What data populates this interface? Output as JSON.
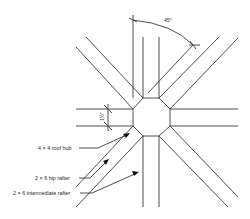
{
  "diagram": {
    "type": "technical-plan-view",
    "dimensions": {
      "angle_label": "45°",
      "width_label": "1½\""
    },
    "labels": {
      "hub": "4 × 4 roof hub",
      "hip_rafter": "2 × 6 hip rafter",
      "intermediate_rafter": "2 × 6 intermediate rafter"
    },
    "colors": {
      "line": "#3a3a3a",
      "background": "#ffffff"
    }
  }
}
